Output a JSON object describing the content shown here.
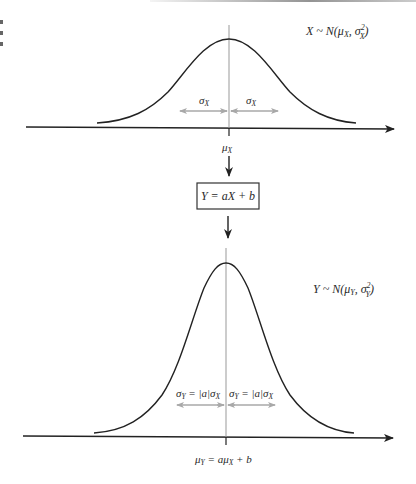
{
  "diagram": {
    "top": {
      "distribution_label": {
        "var": "X",
        "sim": " ~ ",
        "n": "N(",
        "mu": "μ",
        "mu_sub": "X",
        "comma": ", ",
        "sigma": "σ",
        "sigma_sup": "2",
        "sigma_sub": "X",
        "close": ")"
      },
      "sigma_left": {
        "sym": "σ",
        "sub": "X"
      },
      "sigma_right": {
        "sym": "σ",
        "sub": "X"
      },
      "mean_label": {
        "sym": "μ",
        "sub": "X"
      }
    },
    "transform_box": {
      "text": "Y = aX + b"
    },
    "bottom": {
      "distribution_label": {
        "var": "Y",
        "sim": " ~ ",
        "n": "N(",
        "mu": "μ",
        "mu_sub": "Y",
        "comma": ", ",
        "sigma": "σ",
        "sigma_sup": "2",
        "sigma_sub": "Y",
        "close": ")"
      },
      "sigma_left": {
        "sym": "σ",
        "sub": "Y",
        "rest": " = |a|σ",
        "sub2": "X"
      },
      "sigma_right": {
        "sym": "σ",
        "sub": "Y",
        "rest": " = |a|σ",
        "sub2": "X"
      },
      "mean_label": {
        "sym": "μ",
        "sub": "Y",
        "eq": " = aμ",
        "sub2": "X",
        "tail": " + b"
      }
    },
    "colors": {
      "curve": "#222222",
      "axis": "#222222",
      "guide": "#999999",
      "sigma_arrow": "#a8a8a8",
      "text": "#2a2a2a"
    }
  }
}
